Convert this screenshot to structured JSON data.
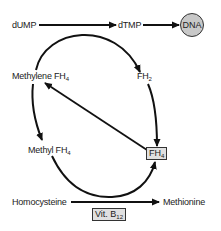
{
  "diagram": {
    "nodes": {
      "dump": {
        "label": "dUMP"
      },
      "dtmp": {
        "label": "dTMP"
      },
      "dna": {
        "label": "DNA"
      },
      "methylene_fh4": {
        "label": "Methylene FH",
        "sub": "4"
      },
      "fh2": {
        "label": "FH",
        "sub": "2"
      },
      "fh4": {
        "label": "FH",
        "sub": "4"
      },
      "methyl_fh4": {
        "label": "Methyl FH",
        "sub": "4"
      },
      "homocysteine": {
        "label": "Homocysteine"
      },
      "methionine": {
        "label": "Methionine"
      },
      "vitb12": {
        "label": "Vit. B",
        "sub": "12"
      }
    },
    "edges": [
      {
        "from": "dUMP",
        "to": "dTMP"
      },
      {
        "from": "dTMP",
        "to": "DNA"
      },
      {
        "from": "Methylene FH4",
        "to": "FH2",
        "note": "coupled curved arrow"
      },
      {
        "from": "FH2",
        "to": "FH4"
      },
      {
        "from": "FH4",
        "to": "Methylene FH4"
      },
      {
        "from": "Methylene FH4",
        "to": "Methyl FH4"
      },
      {
        "from": "Methyl FH4",
        "to": "FH4",
        "note": "coupled curved arrow"
      },
      {
        "from": "Homocysteine",
        "to": "Methionine",
        "cofactor": "Vit. B12"
      }
    ],
    "colors": {
      "line": "#111111",
      "dna_fill": "#c8c8c8",
      "box_fill": "#e0e0e0"
    }
  }
}
